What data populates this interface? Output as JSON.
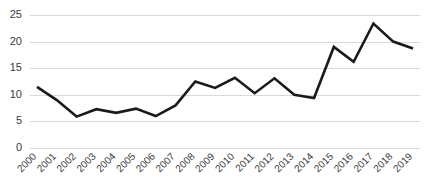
{
  "chart_data": {
    "type": "line",
    "title": "",
    "subtitle": "",
    "xlabel": "",
    "ylabel": "",
    "categories": [
      "2000",
      "2001",
      "2002",
      "2003",
      "2004",
      "2005",
      "2006",
      "2007",
      "2008",
      "2009",
      "2010",
      "2011",
      "2012",
      "2013",
      "2014",
      "2015",
      "2016",
      "2017",
      "2018",
      "2019"
    ],
    "values": [
      11.5,
      9.0,
      5.9,
      7.3,
      6.6,
      7.4,
      6.0,
      8.0,
      12.5,
      11.3,
      13.2,
      10.3,
      13.1,
      10.0,
      9.4,
      19.0,
      16.2,
      23.4,
      20.0,
      18.7
    ],
    "series": [
      {
        "name": "series-1",
        "values": [
          11.5,
          9.0,
          5.9,
          7.3,
          6.6,
          7.4,
          6.0,
          8.0,
          12.5,
          11.3,
          13.2,
          10.3,
          13.1,
          10.0,
          9.4,
          19.0,
          16.2,
          23.4,
          20.0,
          18.7
        ],
        "color": "#1a1a1a"
      }
    ],
    "ylim": [
      0,
      25
    ],
    "yticks": [
      0,
      5,
      10,
      15,
      20,
      25
    ],
    "ytick_labels": [
      "0",
      "5",
      "10",
      "15",
      "20",
      "25"
    ],
    "grid": true,
    "grid_axis": "y",
    "grid_color": "#d9d9d9",
    "legend": false,
    "legend_position": "none",
    "xtick_rotation": 45,
    "line_color": "#1a1a1a",
    "background_color": "#ffffff",
    "markers": false
  }
}
